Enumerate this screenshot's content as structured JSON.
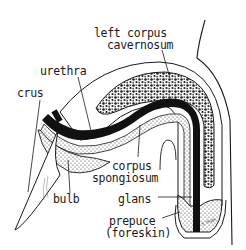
{
  "diagram": {
    "type": "anatomical cross-section illustration",
    "labels": {
      "left_corpus_1": "left corpus",
      "left_corpus_2": "cavernosum",
      "urethra": "urethra",
      "crus": "crus",
      "corpus_1": "corpus",
      "corpus_2": "spongiosum",
      "bulb": "bulb",
      "glans": "glans",
      "prepuce_1": "prepuce",
      "prepuce_2": "(foreskin)"
    },
    "signature": "S. Blyth",
    "colors": {
      "ink": "#1a1a1a",
      "background": "#ffffff",
      "texture": "#2a2a2a"
    }
  }
}
